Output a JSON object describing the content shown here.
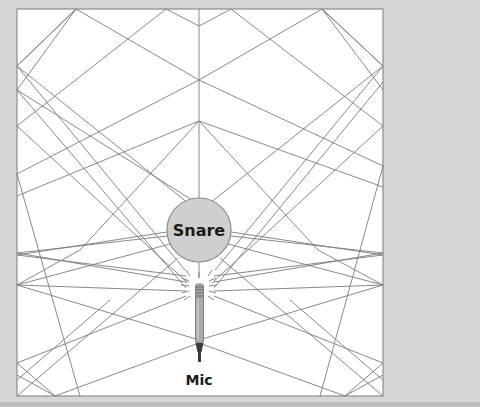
{
  "diagram": {
    "type": "sound-reflection-rays",
    "room": {
      "x": 17,
      "y": 9,
      "width": 366,
      "height": 387,
      "fill": "#ffffff",
      "stroke": "#8c8c8c"
    },
    "colors": {
      "background": "#d6d6d6",
      "ray": "#7a7a7a",
      "snare_fill": "#cfcfcf",
      "snare_stroke": "#8c8c8c",
      "mic_body": "#a9a9a9",
      "mic_tip": "#3a3a3a"
    },
    "snare": {
      "label": "Snare",
      "cx": 199,
      "cy": 230,
      "r": 32
    },
    "mic": {
      "label": "Mic",
      "x": 199,
      "capsule_top": 284,
      "body_bottom": 343,
      "tip_bottom": 362
    }
  }
}
